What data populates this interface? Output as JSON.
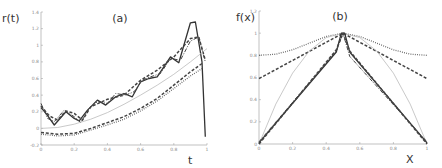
{
  "chart_data": [
    {
      "type": "line",
      "title": "(a)",
      "xlabel": "t",
      "ylabel": "r(t)",
      "xlim": [
        0,
        1
      ],
      "ylim": [
        -0.2,
        1.4
      ],
      "xticks": [
        "0",
        "0.2",
        "0.4",
        "0.6",
        "0.8",
        "1"
      ],
      "yticks": [
        "-0.2",
        "0",
        "0.2",
        "0.4",
        "0.6",
        "0.8",
        "1",
        "1.2",
        "1.4"
      ],
      "grid": false,
      "legend": null,
      "series": [
        {
          "name": "solid-dark",
          "style": "solid",
          "x": [
            0,
            0.03,
            0.08,
            0.15,
            0.2,
            0.23,
            0.28,
            0.34,
            0.39,
            0.45,
            0.5,
            0.55,
            0.6,
            0.65,
            0.7,
            0.78,
            0.83,
            0.9,
            0.93,
            0.97,
            0.99
          ],
          "values": [
            0.25,
            0.18,
            0.04,
            0.2,
            0.12,
            0.09,
            0.22,
            0.34,
            0.28,
            0.38,
            0.42,
            0.38,
            0.56,
            0.6,
            0.62,
            0.86,
            0.79,
            1.27,
            1.28,
            0.8,
            -0.1
          ]
        },
        {
          "name": "dash-dot-dark",
          "style": "dashdot",
          "x": [
            0,
            0.04,
            0.08,
            0.14,
            0.2,
            0.24,
            0.29,
            0.34,
            0.4,
            0.45,
            0.51,
            0.56,
            0.61,
            0.66,
            0.72,
            0.78,
            0.84,
            0.9,
            0.95,
            0.99
          ],
          "values": [
            0.3,
            0.12,
            0.08,
            0.22,
            0.14,
            0.07,
            0.24,
            0.32,
            0.3,
            0.42,
            0.4,
            0.44,
            0.58,
            0.62,
            0.66,
            0.84,
            0.82,
            1.05,
            1.1,
            0.8
          ]
        },
        {
          "name": "dashed-thick",
          "style": "dashed",
          "x": [
            0,
            0.05,
            0.1,
            0.15,
            0.2,
            0.25,
            0.3,
            0.4,
            0.5,
            0.6,
            0.7,
            0.8,
            0.9,
            0.95,
            0.99
          ],
          "values": [
            0.27,
            0.15,
            0.1,
            0.21,
            0.18,
            0.1,
            0.26,
            0.35,
            0.4,
            0.58,
            0.7,
            0.86,
            1.08,
            1.1,
            0.82
          ]
        },
        {
          "name": "light-gray-solid",
          "style": "solid-light",
          "x": [
            0,
            0.1,
            0.2,
            0.3,
            0.4,
            0.5,
            0.6,
            0.7,
            0.8,
            0.9,
            1.0
          ],
          "values": [
            0.0,
            0.01,
            0.05,
            0.11,
            0.19,
            0.29,
            0.4,
            0.52,
            0.65,
            0.8,
            0.96
          ]
        },
        {
          "name": "dashed-lower",
          "style": "dashed",
          "x": [
            0,
            0.1,
            0.2,
            0.3,
            0.4,
            0.5,
            0.6,
            0.7,
            0.8,
            0.9,
            0.97
          ],
          "values": [
            -0.05,
            -0.07,
            -0.06,
            0.0,
            0.07,
            0.14,
            0.24,
            0.36,
            0.52,
            0.68,
            0.78
          ]
        },
        {
          "name": "dotted-lower",
          "style": "dotted",
          "x": [
            0,
            0.1,
            0.2,
            0.3,
            0.4,
            0.5,
            0.6,
            0.7,
            0.8,
            0.9,
            0.97
          ],
          "values": [
            -0.07,
            -0.09,
            -0.08,
            -0.02,
            0.04,
            0.11,
            0.21,
            0.33,
            0.48,
            0.63,
            0.72
          ]
        }
      ]
    },
    {
      "type": "line",
      "title": "(b)",
      "xlabel": "X",
      "ylabel": "f(x)",
      "xlim": [
        0,
        1
      ],
      "ylim": [
        0,
        1.2
      ],
      "xticks": [
        "0",
        "0.2",
        "0.4",
        "0.6",
        "0.8",
        "1"
      ],
      "yticks": [
        "0",
        "0.2",
        "0.4",
        "0.6",
        "0.8",
        "1",
        "1.2"
      ],
      "grid": false,
      "legend": null,
      "series": [
        {
          "name": "dotted-flat",
          "style": "dotted",
          "x": [
            0,
            0.1,
            0.2,
            0.3,
            0.4,
            0.5,
            0.6,
            0.7,
            0.8,
            0.9,
            1.0
          ],
          "values": [
            0.8,
            0.81,
            0.85,
            0.91,
            0.97,
            1.0,
            0.97,
            0.91,
            0.85,
            0.81,
            0.8
          ]
        },
        {
          "name": "dashed-triangle-high",
          "style": "dashed",
          "x": [
            0,
            0.5,
            1.0
          ],
          "values": [
            0.59,
            1.0,
            0.59
          ]
        },
        {
          "name": "light-gray-parabola",
          "style": "solid-light",
          "x": [
            0,
            0.1,
            0.2,
            0.3,
            0.4,
            0.5,
            0.6,
            0.7,
            0.8,
            0.9,
            1.0
          ],
          "values": [
            0.0,
            0.36,
            0.64,
            0.84,
            0.96,
            1.0,
            0.96,
            0.84,
            0.64,
            0.36,
            0.0
          ]
        },
        {
          "name": "solid-dark-triangle",
          "style": "solid",
          "x": [
            0,
            0.46,
            0.49,
            0.51,
            0.54,
            1.0
          ],
          "values": [
            0.01,
            0.83,
            1.0,
            1.0,
            0.83,
            0.01
          ]
        },
        {
          "name": "dash-dot-triangle",
          "style": "dashdot",
          "x": [
            0,
            0.46,
            0.5,
            0.54,
            1.0
          ],
          "values": [
            0.02,
            0.84,
            1.0,
            0.79,
            0.02
          ]
        },
        {
          "name": "dashed-triangle-low",
          "style": "dashed",
          "x": [
            0,
            0.46,
            0.5,
            0.54,
            1.0
          ],
          "values": [
            0.0,
            0.85,
            1.0,
            0.84,
            0.0
          ]
        }
      ]
    }
  ]
}
